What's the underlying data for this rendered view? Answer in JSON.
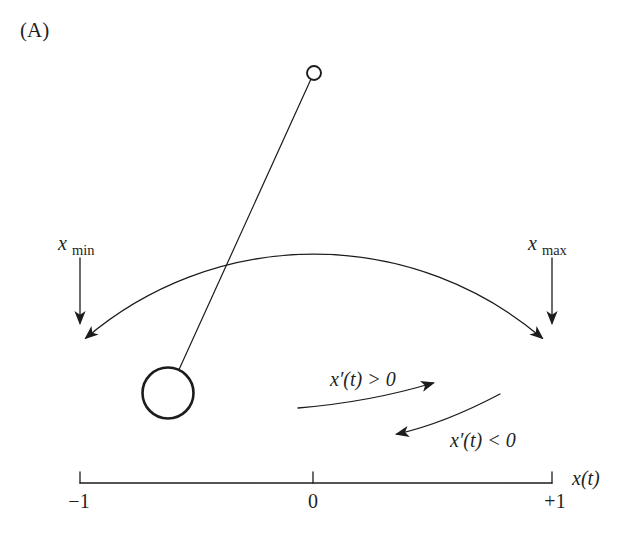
{
  "figure": {
    "panel_label": "(A)",
    "colors": {
      "ink": "#1c1c1c",
      "background": "#ffffff"
    }
  },
  "pendulum": {
    "x_min_label": {
      "base": "x",
      "sub": "min"
    },
    "x_max_label": {
      "base": "x",
      "sub": "max"
    },
    "velocity_positive_label": "x′(t) > 0",
    "velocity_negative_label": "x′(t) < 0"
  },
  "axis": {
    "tick_labels": [
      "−1",
      "0",
      "+1"
    ],
    "axis_label": "x(t)"
  }
}
